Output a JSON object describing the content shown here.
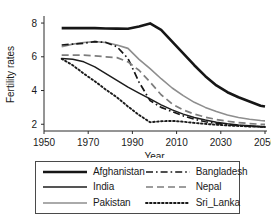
{
  "chart_data": {
    "type": "line",
    "title": "",
    "xlabel": "Year",
    "ylabel": "Fertility rates",
    "xlim": [
      1950,
      2050
    ],
    "ylim": [
      1.6,
      8.3
    ],
    "xticks": [
      1950,
      1970,
      1990,
      2010,
      2030,
      2050
    ],
    "yticks": [
      2,
      4,
      6,
      8
    ],
    "grid": false,
    "legend_position": "below-plot",
    "x": [
      1958,
      1963,
      1968,
      1973,
      1978,
      1983,
      1988,
      1993,
      1998,
      2003,
      2008,
      2013,
      2018,
      2023,
      2028,
      2033,
      2038,
      2043,
      2048,
      2050
    ],
    "series": [
      {
        "name": "Afghanistan",
        "color": "#161616",
        "style": "solid",
        "width": 2.6,
        "values": [
          7.7,
          7.7,
          7.7,
          7.7,
          7.68,
          7.67,
          7.66,
          7.8,
          7.98,
          7.6,
          6.9,
          6.2,
          5.5,
          4.85,
          4.3,
          3.9,
          3.6,
          3.35,
          3.1,
          3.05
        ]
      },
      {
        "name": "India",
        "color": "#1c1c1c",
        "style": "solid",
        "width": 1.5,
        "values": [
          5.9,
          5.85,
          5.7,
          5.4,
          5.0,
          4.6,
          4.2,
          3.85,
          3.5,
          3.15,
          2.85,
          2.6,
          2.4,
          2.25,
          2.12,
          2.03,
          1.96,
          1.91,
          1.87,
          1.86
        ]
      },
      {
        "name": "Pakistan",
        "color": "#8e8e8e",
        "style": "solid",
        "width": 1.6,
        "values": [
          6.6,
          6.75,
          6.85,
          6.9,
          6.85,
          6.7,
          6.5,
          5.85,
          5.3,
          4.7,
          4.15,
          3.7,
          3.3,
          3.0,
          2.75,
          2.55,
          2.4,
          2.3,
          2.22,
          2.2
        ]
      },
      {
        "name": "Bangladesh",
        "color": "#161616",
        "style": "dashdot",
        "width": 1.7,
        "values": [
          6.7,
          6.75,
          6.8,
          6.9,
          6.85,
          6.6,
          5.9,
          4.5,
          3.4,
          3.0,
          2.75,
          2.5,
          2.3,
          2.15,
          2.05,
          1.98,
          1.92,
          1.88,
          1.85,
          1.84
        ]
      },
      {
        "name": "Nepal",
        "color": "#7d7d7d",
        "style": "dashed",
        "width": 1.7,
        "values": [
          6.1,
          6.1,
          6.1,
          6.05,
          6.0,
          5.95,
          5.7,
          5.2,
          4.5,
          3.75,
          3.2,
          2.85,
          2.6,
          2.42,
          2.28,
          2.18,
          2.1,
          2.04,
          2.0,
          1.99
        ]
      },
      {
        "name": "Sri_Lanka",
        "color": "#1a1a1a",
        "style": "dotted",
        "width": 1.9,
        "values": [
          5.88,
          5.5,
          5.0,
          4.55,
          4.05,
          3.6,
          3.05,
          2.55,
          2.12,
          2.18,
          2.2,
          2.15,
          2.08,
          2.02,
          1.97,
          1.93,
          1.9,
          1.87,
          1.85,
          1.84
        ]
      }
    ]
  },
  "legend": {
    "items": [
      {
        "label": "Afghanistan",
        "series": "Afghanistan"
      },
      {
        "label": "Bangladesh",
        "series": "Bangladesh"
      },
      {
        "label": "India",
        "series": "India"
      },
      {
        "label": "Nepal",
        "series": "Nepal"
      },
      {
        "label": "Pakistan",
        "series": "Pakistan"
      },
      {
        "label": "Sri_Lanka",
        "series": "Sri_Lanka"
      }
    ]
  }
}
